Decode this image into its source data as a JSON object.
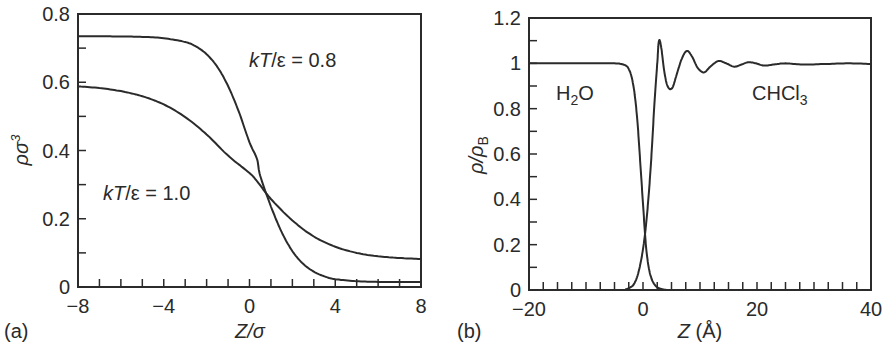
{
  "chart_data": [
    {
      "panel": "(a)",
      "type": "line",
      "title": "",
      "xlabel": "Z/σ",
      "ylabel": "ρσ³",
      "xlim": [
        -8,
        8
      ],
      "ylim": [
        0,
        0.8
      ],
      "xticks_labeled": [
        -8,
        -4,
        0,
        4,
        8
      ],
      "xtick_minor_step": 1,
      "yticks_labeled": [
        0,
        0.2,
        0.4,
        0.6,
        0.8
      ],
      "ytick_labels": [
        "0",
        "0.2",
        "0.4",
        "0.6",
        "0.8"
      ],
      "ytick_minor_step": 0.1,
      "grid": false,
      "legend": null,
      "annotations": [
        {
          "text": "kT/ε = 0.8",
          "x": 1.6,
          "y": 0.665
        },
        {
          "text": "kT/ε = 1.0",
          "x": -6.5,
          "y": 0.275
        }
      ],
      "series": [
        {
          "name": "kT/ε = 0.8",
          "x": [
            -8,
            -7,
            -6,
            -5,
            -4,
            -3,
            -2.5,
            -2,
            -1.5,
            -1,
            -0.5,
            0,
            0.35,
            0.5,
            1,
            1.5,
            2,
            2.5,
            3,
            3.5,
            4,
            5,
            6,
            7,
            8
          ],
          "y": [
            0.735,
            0.735,
            0.734,
            0.733,
            0.729,
            0.718,
            0.705,
            0.682,
            0.645,
            0.589,
            0.514,
            0.424,
            0.375,
            0.326,
            0.236,
            0.161,
            0.105,
            0.068,
            0.045,
            0.031,
            0.023,
            0.017,
            0.015,
            0.015,
            0.015
          ]
        },
        {
          "name": "kT/ε = 1.0",
          "x": [
            -8,
            -7,
            -6,
            -5,
            -4,
            -3,
            -2,
            -1,
            0,
            0.35,
            1,
            2,
            3,
            4,
            5,
            6,
            7,
            8
          ],
          "y": [
            0.588,
            0.583,
            0.574,
            0.559,
            0.535,
            0.498,
            0.447,
            0.385,
            0.334,
            0.31,
            0.258,
            0.195,
            0.148,
            0.118,
            0.1,
            0.09,
            0.085,
            0.082
          ]
        }
      ]
    },
    {
      "panel": "(b)",
      "type": "line",
      "title": "",
      "xlabel": "Z (Å)",
      "ylabel": "ρ/ρB",
      "xlim": [
        -20,
        40
      ],
      "ylim": [
        0,
        1.2
      ],
      "xticks_labeled": [
        -20,
        0,
        20,
        40
      ],
      "xtick_minor_step": 2.5,
      "yticks_labeled": [
        0,
        0.2,
        0.4,
        0.6,
        0.8,
        1,
        1.2
      ],
      "ytick_labels": [
        "0",
        "0.2",
        "0.4",
        "0.6",
        "0.8",
        "1",
        "1.2"
      ],
      "ytick_minor_step": 0.1,
      "grid": false,
      "legend": null,
      "annotations": [
        {
          "text": "H2O",
          "x": -15,
          "y": 0.88
        },
        {
          "text": "CHCl3",
          "x": 20,
          "y": 0.88
        }
      ],
      "series": [
        {
          "name": "H2O",
          "x": [
            -20,
            -10,
            -5,
            -4,
            -3,
            -2.5,
            -2,
            -1.5,
            -1,
            -0.5,
            0,
            0.5,
            1,
            1.5,
            2,
            2.5,
            3,
            3.5,
            4,
            6,
            40
          ],
          "y": [
            1.0,
            1.0,
            1.0,
            0.998,
            0.99,
            0.975,
            0.94,
            0.87,
            0.75,
            0.57,
            0.38,
            0.2,
            0.1,
            0.05,
            0.025,
            0.012,
            0.006,
            0.003,
            0.001,
            0.0,
            0.0
          ]
        },
        {
          "name": "CHCl3",
          "x": [
            -20,
            -4,
            -3,
            -2,
            -1.5,
            -1,
            -0.5,
            0,
            0.5,
            1,
            1.5,
            2,
            2.5,
            2.8,
            3.2,
            3.7,
            4.3,
            5.1,
            5.9,
            6.8,
            7.7,
            8.6,
            9.6,
            10.7,
            11.8,
            13.2,
            14.6,
            16.0,
            17.3,
            18.5,
            19.8,
            21.2,
            23,
            25,
            28,
            32,
            36,
            40
          ],
          "y": [
            0.0,
            0.0,
            0.003,
            0.015,
            0.03,
            0.06,
            0.11,
            0.18,
            0.28,
            0.42,
            0.6,
            0.82,
            1.0,
            1.1,
            1.07,
            0.97,
            0.9,
            0.89,
            0.95,
            1.02,
            1.055,
            1.03,
            0.98,
            0.96,
            0.985,
            1.01,
            1.0,
            0.985,
            0.995,
            1.005,
            1.0,
            0.99,
            0.995,
            1.0,
            0.995,
            0.997,
            1.0,
            0.997
          ]
        }
      ]
    }
  ],
  "panels": {
    "a": {
      "label": "(a)",
      "xlabel": "Z/σ",
      "ylabel_base": "ρσ",
      "ylabel_sup": "3",
      "annot1": {
        "prefix": "kT",
        "mid": "/ε = ",
        "value": "0.8"
      },
      "annot2": {
        "prefix": "kT",
        "mid": "/ε = ",
        "value": "1.0"
      }
    },
    "b": {
      "label": "(b)",
      "xlabel_var": "Z",
      "xlabel_unit": " (Å)",
      "ylabel_num": "ρ/ρ",
      "ylabel_sub": "B",
      "h2o": {
        "base1": "H",
        "sub": "2",
        "base2": "O"
      },
      "chcl3": {
        "base": "CHCl",
        "sub": "3"
      }
    }
  },
  "colors": {
    "line": "#2b2b2b",
    "text": "#2a2a2a",
    "background": "#ffffff"
  }
}
